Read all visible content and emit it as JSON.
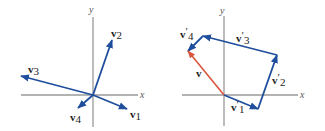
{
  "colors": {
    "axis": "#9a9a9a",
    "vector": "#1f4e9c",
    "resultant": "#d9553d"
  },
  "left_diagram": {
    "axis_labels": {
      "x": "x",
      "y": "y"
    },
    "vectors": [
      {
        "name": "v",
        "sub": "1"
      },
      {
        "name": "v",
        "sub": "2"
      },
      {
        "name": "v",
        "sub": "3"
      },
      {
        "name": "v",
        "sub": "4"
      }
    ]
  },
  "right_diagram": {
    "axis_labels": {
      "x": "x",
      "y": "y"
    },
    "vectors": [
      {
        "name": "v",
        "prime": "′",
        "sub": "1"
      },
      {
        "name": "v",
        "prime": "′",
        "sub": "2"
      },
      {
        "name": "v",
        "prime": "′",
        "sub": "3"
      },
      {
        "name": "v",
        "prime": "′",
        "sub": "4"
      }
    ],
    "resultant": {
      "name": "v"
    }
  }
}
